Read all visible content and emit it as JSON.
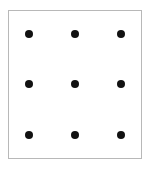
{
  "diagram": {
    "type": "dot-grid",
    "rows": 3,
    "columns": 3,
    "dot_color": "#111111",
    "border_color": "#b8b8b8",
    "background": "#ffffff",
    "dots": [
      {
        "row": 1,
        "col": 1,
        "x": 29,
        "y": 34
      },
      {
        "row": 1,
        "col": 2,
        "x": 75,
        "y": 34
      },
      {
        "row": 1,
        "col": 3,
        "x": 121,
        "y": 34
      },
      {
        "row": 2,
        "col": 1,
        "x": 29,
        "y": 84
      },
      {
        "row": 2,
        "col": 2,
        "x": 75,
        "y": 84
      },
      {
        "row": 2,
        "col": 3,
        "x": 121,
        "y": 84
      },
      {
        "row": 3,
        "col": 1,
        "x": 29,
        "y": 135
      },
      {
        "row": 3,
        "col": 2,
        "x": 75,
        "y": 135
      },
      {
        "row": 3,
        "col": 3,
        "x": 121,
        "y": 135
      }
    ]
  }
}
